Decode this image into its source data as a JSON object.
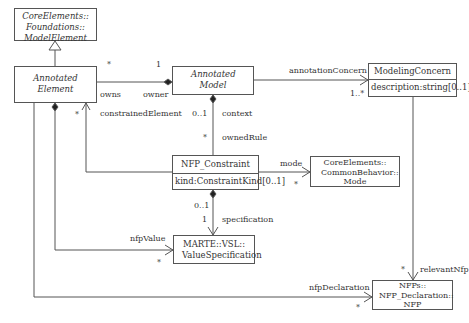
{
  "classes": {
    "model_element": {
      "name": "CoreElements:: Foundations:: ModelElement",
      "abstract": true
    },
    "annotated_element": {
      "name": "Annotated Element",
      "abstract": true
    },
    "annotated_model": {
      "name": "Annotated Model",
      "abstract": true
    },
    "modeling_concern": {
      "name": "ModelingConcern",
      "attribute": "description:string[0..1]"
    },
    "nfp_constraint": {
      "name": "NFP_Constraint",
      "attribute": "kind:ConstraintKind[0..1]"
    },
    "mode": {
      "name": "CoreElements:: CommonBehavior:: Mode"
    },
    "value_specification": {
      "name": "MARTE::VSL:: ValueSpecification"
    },
    "nfp": {
      "name": "NFPs:: NFP_Declaration:: NFP"
    }
  },
  "labels": {
    "owns_mult": "*",
    "owner_mult": "1",
    "owns": "owns",
    "owner": "owner",
    "constrained_mult": "*",
    "constrained_element": "constrainedElement",
    "context_mult": "0..1",
    "context": "context",
    "owned_rule_mult": "*",
    "owned_rule": "ownedRule",
    "annotation_concern": "annotationConcern",
    "annotation_concern_mult": "1..*",
    "mode": "mode",
    "mode_mult": "*",
    "spec_owner_mult": "0..1",
    "spec_mult": "1",
    "specification": "specification",
    "nfp_value": "nfpValue",
    "nfp_value_mult": "*",
    "relevant_nfp_mult": "*",
    "relevant_nfp": "relevantNfp",
    "nfp_declaration": "nfpDeclaration",
    "nfp_declaration_mult": "*"
  }
}
